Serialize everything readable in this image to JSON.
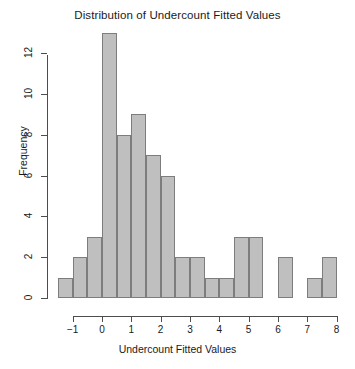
{
  "chart_data": {
    "type": "bar",
    "title": "Distribution of Undercount Fitted Values",
    "xlabel": "Undercount Fitted Values",
    "ylabel": "Frequency",
    "subtitle": "",
    "grid": false,
    "legend": "none",
    "bin_width": 0.5,
    "bin_edges": [
      -1.5,
      -1.0,
      -0.5,
      0.0,
      0.5,
      1.0,
      1.5,
      2.0,
      2.5,
      3.0,
      3.5,
      4.0,
      4.5,
      5.0,
      5.5,
      6.0,
      6.5,
      7.0,
      7.5,
      8.0
    ],
    "categories": [
      "-1.5 to -1.0",
      "-1.0 to -0.5",
      "-0.5 to 0.0",
      "0.0 to 0.5",
      "0.5 to 1.0",
      "1.0 to 1.5",
      "1.5 to 2.0",
      "2.0 to 2.5",
      "2.5 to 3.0",
      "3.0 to 3.5",
      "3.5 to 4.0",
      "4.0 to 4.5",
      "4.5 to 5.0",
      "5.0 to 5.5",
      "5.5 to 6.0",
      "6.0 to 6.5",
      "6.5 to 7.0",
      "7.0 to 7.5",
      "7.5 to 8.0"
    ],
    "values": [
      1,
      2,
      3,
      13,
      8,
      9,
      7,
      6,
      2,
      2,
      1,
      1,
      3,
      3,
      0,
      2,
      0,
      1,
      2
    ],
    "xlim": [
      -1.5,
      8.0
    ],
    "ylim": [
      0,
      13
    ],
    "x_ticks": [
      -1,
      0,
      1,
      2,
      3,
      4,
      5,
      6,
      7,
      8
    ],
    "x_tick_labels": [
      "-1",
      "0",
      "1",
      "2",
      "3",
      "4",
      "5",
      "6",
      "7",
      "8"
    ],
    "y_ticks": [
      0,
      2,
      4,
      6,
      8,
      10,
      12
    ],
    "y_tick_labels": [
      "0",
      "2",
      "4",
      "6",
      "8",
      "10",
      "12"
    ],
    "bar_fill_color": "#bfbfbf",
    "bar_border_color": "#7d7d7d",
    "axis_color": "#4d4d4d",
    "background_color": "#ffffff"
  }
}
